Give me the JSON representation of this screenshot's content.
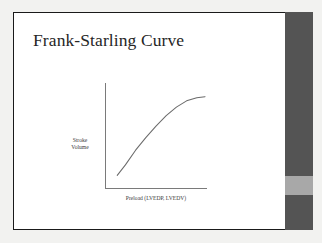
{
  "slide": {
    "title": "Frank-Starling Curve",
    "background_color": "#ffffff",
    "border_color": "#1a1a1a"
  },
  "page": {
    "background_color": "#f2f2f0"
  },
  "scrollbar": {
    "track_color": "#545454",
    "thumb_color": "#a8a8a8",
    "thumb_top_px": 176,
    "thumb_height_px": 19
  },
  "chart_data": {
    "type": "line",
    "title": "Frank-Starling Curve",
    "xlabel": "Preload (LVEDP, LVEDV)",
    "ylabel_line1": "Stroke",
    "ylabel_line2": "Volume",
    "ylabel": "Stroke Volume",
    "grid": false,
    "legend": false,
    "axis_color": "#7a7a7a",
    "line_color": "#6b6b6b",
    "xlim": [
      0,
      100
    ],
    "ylim": [
      0,
      100
    ],
    "tick_labels_x": [],
    "tick_labels_y": [],
    "series": [
      {
        "name": "Frank-Starling curve",
        "x": [
          12,
          20,
          30,
          40,
          50,
          60,
          70,
          80,
          90,
          98
        ],
        "y": [
          12,
          22,
          36,
          48,
          59,
          69,
          77,
          83,
          86,
          87
        ]
      }
    ]
  }
}
